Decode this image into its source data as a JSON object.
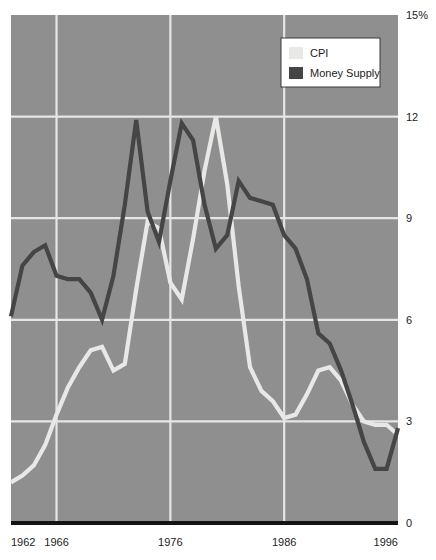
{
  "chart_data": {
    "type": "line",
    "title": "",
    "subtitle": "",
    "xlabel": "",
    "ylabel": "",
    "xlim": [
      1962,
      1996
    ],
    "ylim": [
      0,
      15
    ],
    "grid": true,
    "y_ticks": [
      0,
      3,
      6,
      9,
      12,
      15
    ],
    "y_tick_labels": [
      "0",
      "3",
      "6",
      "9",
      "12",
      "15%"
    ],
    "x_ticks": [
      1962,
      1966,
      1976,
      1986,
      1996
    ],
    "x_tick_labels": [
      "1962",
      "1966",
      "1976",
      "1986",
      "1996"
    ],
    "x_gridlines": [
      1966,
      1976,
      1986
    ],
    "legend_position": "top-right",
    "legend_entries": [
      "CPI",
      "Money Supply"
    ],
    "x": [
      1962,
      1963,
      1964,
      1965,
      1966,
      1967,
      1968,
      1969,
      1970,
      1971,
      1972,
      1973,
      1974,
      1975,
      1976,
      1977,
      1978,
      1979,
      1980,
      1981,
      1982,
      1983,
      1984,
      1985,
      1986,
      1987,
      1988,
      1989,
      1990,
      1991,
      1992,
      1993,
      1994,
      1995,
      1996
    ],
    "series": [
      {
        "name": "CPI",
        "color": "#e8e8e6",
        "values": [
          1.2,
          1.4,
          1.7,
          2.3,
          3.2,
          4.0,
          4.6,
          5.1,
          5.2,
          4.5,
          4.7,
          6.9,
          8.9,
          8.7,
          7.1,
          6.6,
          8.4,
          10.4,
          12.0,
          10.0,
          7.0,
          4.6,
          3.9,
          3.6,
          3.1,
          3.2,
          3.8,
          4.5,
          4.6,
          4.2,
          3.5,
          3.0,
          2.9,
          2.9,
          2.6
        ]
      },
      {
        "name": "Money Supply",
        "color": "#454545",
        "values": [
          6.1,
          7.6,
          8.0,
          8.2,
          7.3,
          7.2,
          7.2,
          6.8,
          6.0,
          7.3,
          9.4,
          11.9,
          9.2,
          8.3,
          10.1,
          11.8,
          11.3,
          9.4,
          8.1,
          8.5,
          10.1,
          9.6,
          9.5,
          9.4,
          8.5,
          8.1,
          7.2,
          5.6,
          5.3,
          4.5,
          3.5,
          2.4,
          1.6,
          1.6,
          2.8
        ]
      }
    ]
  },
  "legend": {
    "items": [
      {
        "label": "CPI",
        "swatch_color": "#e8e8e6"
      },
      {
        "label": "Money Supply",
        "swatch_color": "#454545"
      }
    ]
  },
  "axes": {
    "y_labels": [
      "15%",
      "12",
      "9",
      "6",
      "3",
      "0"
    ],
    "x_labels": [
      "1962",
      "1966",
      "1976",
      "1986",
      "1996"
    ]
  },
  "colors": {
    "plot_background": "#8f8f8f",
    "gridline": "#e6e6e6",
    "baseline": "#141414",
    "cpi_line": "#eaeae8",
    "money_supply_line": "#454545",
    "legend_background": "#ffffff",
    "legend_border": "#3a3a3a",
    "text": "#1b1b1b"
  }
}
